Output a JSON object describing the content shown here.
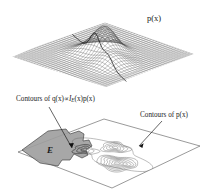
{
  "figure": {
    "title_top": "p(x)",
    "labels": {
      "density_label": "p(x)",
      "q_contours_prefix": "Contours of q(x)",
      "q_contours_propto": "∝",
      "q_contours_indicator": "I",
      "q_contours_indicator_sub": "E",
      "q_contours_suffix": "(x)p(x)",
      "p_contours": "Contours of p(x)",
      "region_label": "E"
    },
    "colors": {
      "background": "#ffffff",
      "ink": "#1a1a1a",
      "mesh": "#4a4a4a",
      "plane_outline": "#555555",
      "region_fill": "#9a9a9a",
      "region_stroke": "#4a4a4a",
      "contour_stroke": "#666666",
      "leader_line": "#222222"
    }
  },
  "chart_data": [
    {
      "type": "surface",
      "name": "top-density-surface",
      "title": "p(x)",
      "xlabel": "",
      "ylabel": "",
      "zlabel": "p(x)",
      "grid": true,
      "description": "3D wireframe mesh of a bivariate probability density p(x) drawn on a rhombic (isometric) base plane. Surface is flat near the edges with one tall central peak and a lower secondary ridge/bump to the right.",
      "mesh": {
        "rows": 34,
        "cols": 34
      },
      "peaks": [
        {
          "name": "primary-mode",
          "u": 0.46,
          "v": 0.46,
          "height": 1.0,
          "sigma": 0.09
        },
        {
          "name": "secondary-mode",
          "u": 0.66,
          "v": 0.6,
          "height": 0.42,
          "sigma": 0.1
        },
        {
          "name": "minor-mode",
          "u": 0.33,
          "v": 0.56,
          "height": 0.18,
          "sigma": 0.09
        }
      ]
    },
    {
      "type": "contour",
      "name": "bottom-contour-plot",
      "title": "",
      "xlabel": "",
      "ylabel": "",
      "grid": false,
      "description": "Contour (level-set) map of the same density p(x) drawn on an isometric rhombic plane. A shaded polygonal region E occupies the left portion; the contours of q(x), proportional to the indicator of E times p(x), are the level sets clipped to E. Separate nested contour groups of p(x) appear at center and right.",
      "levels": [
        0.1,
        0.2,
        0.35,
        0.5,
        0.65,
        0.8,
        0.95
      ],
      "contour_groups": [
        {
          "name": "center-mode-contours",
          "rings": 5,
          "cu": 0.46,
          "cv": 0.38
        },
        {
          "name": "right-mode-contours",
          "rings": 7,
          "cu": 0.7,
          "cv": 0.6
        },
        {
          "name": "clipped-q-contours",
          "rings": 3,
          "cu": 0.33,
          "cv": 0.58
        }
      ],
      "annotations": [
        {
          "text": "Contours of q(x) ∝ I_E(x)p(x)",
          "points_to": "clipped-q-contours"
        },
        {
          "text": "Contours of p(x)",
          "points_to": "right-mode-contours"
        },
        {
          "text": "E",
          "points_to": "shaded-region"
        }
      ]
    }
  ]
}
